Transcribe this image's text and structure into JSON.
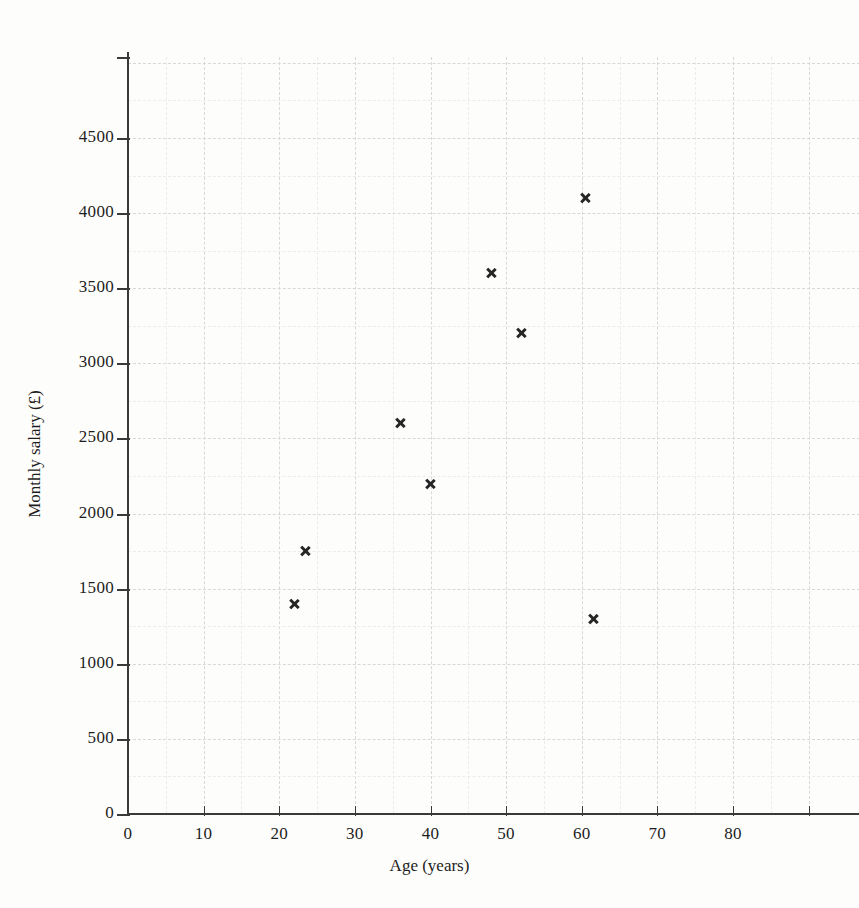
{
  "chart_data": {
    "type": "scatter",
    "title": "",
    "xlabel": "Age (years)",
    "ylabel": "Monthly salary (£)",
    "xlim": [
      0,
      91
    ],
    "ylim": [
      0,
      5060
    ],
    "xticks": [
      0,
      10,
      20,
      30,
      40,
      50,
      60,
      70,
      80
    ],
    "xtick_labels": [
      "0",
      "10",
      "20",
      "30",
      "40",
      "50",
      "60",
      "70",
      "80"
    ],
    "yticks": [
      0,
      500,
      1000,
      1500,
      2000,
      2500,
      3000,
      3500,
      4000,
      4500
    ],
    "ytick_labels": [
      "0",
      "500",
      "1000",
      "1500",
      "2000",
      "2500",
      "3000",
      "3500",
      "4000",
      "4500"
    ],
    "grid": true,
    "grid_color": "#d8d8d8",
    "grid_style": "dashed",
    "legend": "none",
    "marker": "x",
    "marker_color": "#262626",
    "points": [
      {
        "x": 22,
        "y": 1400
      },
      {
        "x": 23.5,
        "y": 1750
      },
      {
        "x": 36,
        "y": 2600
      },
      {
        "x": 40,
        "y": 2200
      },
      {
        "x": 48,
        "y": 3600
      },
      {
        "x": 52,
        "y": 3200
      },
      {
        "x": 60.5,
        "y": 4100
      },
      {
        "x": 61.5,
        "y": 1300
      }
    ]
  },
  "axes": {
    "x_title": "Age (years)",
    "y_title": "Monthly salary (£)"
  }
}
